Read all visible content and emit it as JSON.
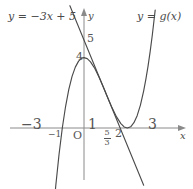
{
  "figure": {
    "width": 193,
    "height": 189,
    "background": "#ffffff",
    "axis_color": "#808080",
    "curve_color": "#4a4a4a",
    "label_color": "#555555"
  },
  "labels": {
    "line_equation": "y = −3x + 5",
    "curve_equation": "y = g(x)",
    "y_axis_name": "y",
    "x_axis_name": "x",
    "origin": "O"
  },
  "ticks": {
    "x": [
      {
        "text": "−3",
        "value": -3
      },
      {
        "text": "−1",
        "value": -1
      },
      {
        "text": "1",
        "value": 1
      },
      {
        "text": "2",
        "value": 2
      },
      {
        "text": "3",
        "value": 3
      }
    ],
    "x_fraction": {
      "numerator": "5",
      "denominator": "3",
      "value": 1.6667
    },
    "y": [
      {
        "text": "4",
        "value": 4
      },
      {
        "text": "5",
        "value": 5
      }
    ]
  },
  "chart_data": {
    "type": "line",
    "title": "",
    "xlabel": "x",
    "ylabel": "y",
    "xlim": [
      -3.6,
      3.6
    ],
    "ylim": [
      -3.4,
      6.6
    ],
    "grid": false,
    "legend": "inline-labels",
    "series": [
      {
        "name": "y = g(x)",
        "kind": "cubic",
        "expression": "x^3 - 3x^2 + 4",
        "color": "#4a4a4a",
        "x_intercepts": [
          -1,
          2
        ],
        "local_max": {
          "x": 0,
          "y": 4
        },
        "local_min": {
          "x": 2,
          "y": 0
        },
        "points": [
          [
            -1.45,
            -5.35
          ],
          [
            -1.3,
            -3.27
          ],
          [
            -1.15,
            -1.49
          ],
          [
            -1.0,
            0.0
          ],
          [
            -0.85,
            1.22
          ],
          [
            -0.7,
            2.19
          ],
          [
            -0.55,
            2.93
          ],
          [
            -0.4,
            3.46
          ],
          [
            -0.25,
            3.8
          ],
          [
            -0.1,
            3.97
          ],
          [
            0.0,
            4.0
          ],
          [
            0.15,
            3.94
          ],
          [
            0.3,
            3.76
          ],
          [
            0.5,
            3.38
          ],
          [
            0.7,
            2.87
          ],
          [
            0.9,
            2.3
          ],
          [
            1.1,
            1.7
          ],
          [
            1.3,
            1.13
          ],
          [
            1.5,
            0.63
          ],
          [
            1.7,
            0.25
          ],
          [
            1.85,
            0.06
          ],
          [
            2.0,
            0.0
          ],
          [
            2.15,
            0.07
          ],
          [
            2.3,
            0.3
          ],
          [
            2.45,
            0.7
          ],
          [
            2.6,
            1.3
          ],
          [
            2.75,
            2.11
          ],
          [
            2.85,
            2.76
          ],
          [
            2.95,
            3.5
          ],
          [
            3.05,
            4.35
          ],
          [
            3.15,
            5.3
          ],
          [
            3.22,
            6.05
          ],
          [
            3.28,
            6.7
          ]
        ]
      },
      {
        "name": "y = -3x + 5",
        "kind": "line",
        "expression": "-3x + 5",
        "color": "#4a4a4a",
        "slope": -3,
        "y_intercept": 5,
        "x_intercept": 1.6667,
        "points": [
          [
            -0.65,
            6.95
          ],
          [
            2.75,
            -3.25
          ]
        ]
      }
    ]
  }
}
